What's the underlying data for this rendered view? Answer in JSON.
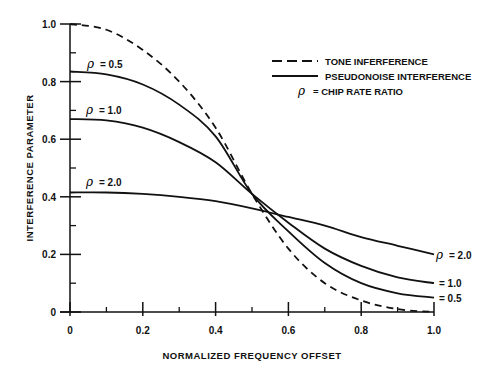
{
  "chart_data": {
    "type": "line",
    "title": "",
    "xlabel": "NORMALIZED FREQUENCY OFFSET",
    "ylabel": "INTERFERENCE PARAMETER",
    "xlim": [
      0,
      1.0
    ],
    "ylim": [
      0,
      1.0
    ],
    "grid": false,
    "x_ticks": [
      "0",
      "0.2",
      "0.4",
      "0.6",
      "0.8",
      "1.0"
    ],
    "x_tick_values": [
      0,
      0.2,
      0.4,
      0.6,
      0.8,
      1.0
    ],
    "x_minor_ticks": [
      0.1,
      0.3,
      0.5,
      0.7,
      0.9
    ],
    "y_ticks": [
      "0",
      "0.2",
      "0.4",
      "0.6",
      "0.8",
      "1.0"
    ],
    "y_tick_values": [
      0,
      0.2,
      0.4,
      0.6,
      0.8,
      1.0
    ],
    "y_minor_ticks": [
      0.1,
      0.3,
      0.5,
      0.7,
      0.9
    ],
    "legend_position": "upper right",
    "legend": [
      {
        "style": "dashed",
        "label": "TONE INFERFERENCE"
      },
      {
        "style": "solid",
        "label": "PSEUDONOISE INTERFERENCE"
      },
      {
        "style": "symbol",
        "symbol": "ρ",
        "label": "= CHIP RATE RATIO"
      }
    ],
    "x": [
      0,
      0.1,
      0.2,
      0.3,
      0.4,
      0.5,
      0.6,
      0.7,
      0.8,
      0.9,
      1.0
    ],
    "series": [
      {
        "name": "Tone interference",
        "style": "dashed",
        "values": [
          1.0,
          0.98,
          0.91,
          0.8,
          0.64,
          0.41,
          0.22,
          0.1,
          0.04,
          0.01,
          0.0
        ]
      },
      {
        "name": "Pseudonoise ρ = 0.5",
        "style": "solid",
        "values": [
          0.835,
          0.825,
          0.79,
          0.72,
          0.61,
          0.41,
          0.28,
          0.17,
          0.1,
          0.065,
          0.05
        ]
      },
      {
        "name": "Pseudonoise ρ = 1.0",
        "style": "solid",
        "values": [
          0.67,
          0.665,
          0.64,
          0.59,
          0.52,
          0.41,
          0.31,
          0.22,
          0.16,
          0.12,
          0.1
        ]
      },
      {
        "name": "Pseudonoise ρ = 2.0",
        "style": "solid",
        "values": [
          0.415,
          0.415,
          0.41,
          0.4,
          0.385,
          0.36,
          0.33,
          0.3,
          0.26,
          0.23,
          0.2
        ]
      }
    ],
    "annotations": [
      {
        "text": "ρ = 0.5",
        "at": "left",
        "series": 1
      },
      {
        "text": "ρ = 1.0",
        "at": "left",
        "series": 2
      },
      {
        "text": "ρ = 2.0",
        "at": "left",
        "series": 3
      },
      {
        "text": "ρ = 2.0",
        "at": "right",
        "series": 3
      },
      {
        "text": "= 1.0",
        "at": "right",
        "series": 2
      },
      {
        "text": "= 0.5",
        "at": "right",
        "series": 1
      }
    ]
  },
  "labels": {
    "xlabel": "NORMALIZED FREQUENCY OFFSET",
    "ylabel": "INTERFERENCE PARAMETER",
    "legend_tone": "TONE INFERFERENCE",
    "legend_pn": "PSEUDONOISE INTERFERENCE",
    "legend_rho_symbol": "ρ",
    "legend_rho": "= CHIP RATE RATIO",
    "left_rho_05": "= 0.5",
    "left_rho_10": "= 1.0",
    "left_rho_20": "= 2.0",
    "right_rho_20": "= 2.0",
    "right_rho_10": "= 1.0",
    "right_rho_05": "= 0.5",
    "rho": "ρ"
  },
  "colors": {
    "ink": "#111111",
    "background": "#ffffff"
  }
}
